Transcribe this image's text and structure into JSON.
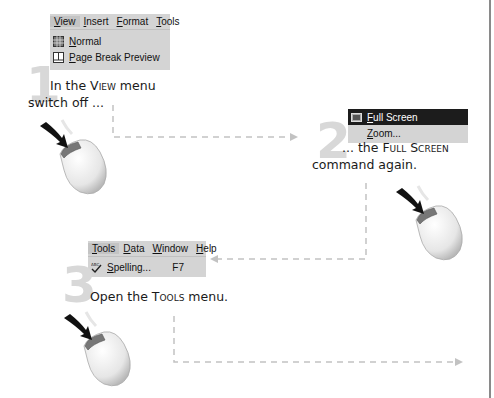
{
  "steps": [
    {
      "number": "1",
      "menu": {
        "bar": [
          "View",
          "Insert",
          "Format",
          "Tools"
        ],
        "items": [
          {
            "label": "Normal",
            "icon": "normal-view-icon"
          },
          {
            "label": "Page Break Preview",
            "icon": "page-break-preview-icon"
          }
        ]
      },
      "text_line1_prefix": "In the ",
      "text_line1_caps": "View",
      "text_line1_suffix": " menu",
      "text_line2": "switch off ..."
    },
    {
      "number": "2",
      "menu": {
        "items": [
          {
            "label": "Full Screen",
            "icon": "full-screen-icon",
            "highlighted": true
          },
          {
            "label": "Zoom..."
          }
        ]
      },
      "text_line1_prefix": "... the ",
      "text_line1_caps": "Full Screen",
      "text_line2": "command again."
    },
    {
      "number": "3",
      "menu": {
        "bar": [
          "Tools",
          "Data",
          "Window",
          "Help"
        ],
        "items": [
          {
            "label": "Spelling...",
            "icon": "spelling-icon",
            "shortcut": "F7"
          }
        ]
      },
      "text_line1_prefix": "Open the ",
      "text_line1_caps": "Tools",
      "text_line1_suffix": " menu."
    }
  ],
  "colors": {
    "step_number": "#d8d8d8",
    "menu_bg": "#d4d4d4",
    "highlight_bg": "#1c1c1c",
    "connector": "#bdbdbd"
  }
}
